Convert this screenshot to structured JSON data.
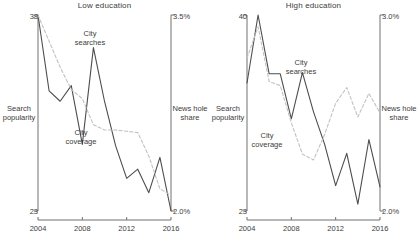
{
  "figure": {
    "background": "#ffffff",
    "series_colors": {
      "city_searches": "#4d4d4d",
      "city_coverage": "#c2c2c2"
    },
    "axis_color": "#707070"
  },
  "panels": [
    {
      "id": "low",
      "title": "Low education",
      "left_axis_label": "Search\npopularity",
      "right_axis_label": "News hole\nshare",
      "left_top_tick": "38",
      "left_bottom_tick": "23",
      "right_top_tick": "3.5%",
      "right_bottom_tick": "2.0%",
      "x_ticks": [
        "2004",
        "2008",
        "2012",
        "2016"
      ],
      "annotations": [
        {
          "name": "city-searches",
          "text": "City\nsearches"
        },
        {
          "name": "city-coverage",
          "text": "City\ncoverage"
        }
      ]
    },
    {
      "id": "high",
      "title": "High education",
      "left_axis_label": "Search\npopularity",
      "right_axis_label": "News hole\nshare",
      "left_top_tick": "40",
      "left_bottom_tick": "23",
      "right_top_tick": "3.0%",
      "right_bottom_tick": "2.0%",
      "x_ticks": [
        "2004",
        "2008",
        "2012",
        "2016"
      ],
      "annotations": [
        {
          "name": "city-searches",
          "text": "City\nsearches"
        },
        {
          "name": "city-coverage",
          "text": "City\ncoverage"
        }
      ]
    }
  ],
  "chart_data": [
    {
      "type": "line",
      "title": "Low education",
      "xlabel": "",
      "ylabel": "Search popularity",
      "y2label": "News hole share",
      "x": [
        2004,
        2005,
        2006,
        2007,
        2008,
        2009,
        2010,
        2011,
        2012,
        2013,
        2014,
        2015,
        2016
      ],
      "xlim": [
        2004,
        2016
      ],
      "ylim": [
        23,
        38
      ],
      "y2lim": [
        2.0,
        3.5
      ],
      "grid": false,
      "legend": "annotations",
      "series": [
        {
          "name": "City searches",
          "axis": "left",
          "style": "solid",
          "color": "#4d4d4d",
          "values": [
            38.0,
            32.2,
            31.4,
            32.6,
            28.1,
            35.5,
            31.4,
            28.0,
            25.5,
            26.2,
            24.4,
            27.1,
            23.0
          ]
        },
        {
          "name": "City coverage",
          "axis": "right",
          "style": "dashed",
          "color": "#c2c2c2",
          "values": [
            3.5,
            3.3,
            3.1,
            2.93,
            2.86,
            2.66,
            2.62,
            2.62,
            2.61,
            2.6,
            2.42,
            2.17,
            2.12
          ]
        }
      ]
    },
    {
      "type": "line",
      "title": "High education",
      "xlabel": "",
      "ylabel": "Search popularity",
      "y2label": "News hole share",
      "x": [
        2004,
        2005,
        2006,
        2007,
        2008,
        2009,
        2010,
        2011,
        2012,
        2013,
        2014,
        2015,
        2016
      ],
      "xlim": [
        2004,
        2016
      ],
      "ylim": [
        23,
        40
      ],
      "y2lim": [
        2.0,
        3.0
      ],
      "grid": false,
      "legend": "annotations",
      "series": [
        {
          "name": "City searches",
          "axis": "left",
          "style": "solid",
          "color": "#4d4d4d",
          "values": [
            34.1,
            40.0,
            34.9,
            34.9,
            31.0,
            35.0,
            31.6,
            28.8,
            25.2,
            28.0,
            23.6,
            29.2,
            25.1
          ]
        },
        {
          "name": "City coverage",
          "axis": "right",
          "style": "dashed",
          "color": "#c2c2c2",
          "values": [
            2.78,
            2.94,
            2.66,
            2.64,
            2.45,
            2.29,
            2.26,
            2.39,
            2.55,
            2.63,
            2.48,
            2.6,
            2.5
          ]
        }
      ]
    }
  ]
}
